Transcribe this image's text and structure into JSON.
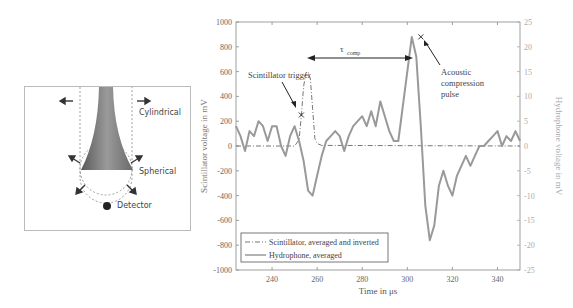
{
  "diagram": {
    "labels": {
      "cylindrical": "Cylindrical",
      "spherical": "Spherical",
      "detector": "Detector"
    }
  },
  "chart_data": {
    "type": "line",
    "xlabel": "Time in μs",
    "ylabel_left": "Scintillator voltage in mV",
    "ylabel_right": "Hydrophone voltage in mV",
    "xlim": [
      224,
      350
    ],
    "ylim_left": [
      -1000,
      1000
    ],
    "ylim_right": [
      -25,
      25
    ],
    "x_ticks": [
      "240",
      "260",
      "280",
      "300",
      "320",
      "340"
    ],
    "y_ticks_left": [
      "1000",
      "800",
      "600",
      "400",
      "200",
      "0",
      "-200",
      "-400",
      "-600",
      "-800",
      "-1000"
    ],
    "y_ticks_right": [
      "25",
      "20",
      "15",
      "10",
      "5",
      "0",
      "-5",
      "-10",
      "-15",
      "-20",
      "-25"
    ],
    "annotations": {
      "tau": "τ",
      "tau_sub": "comp",
      "trigger": "Scintillator trigger",
      "pulse_line1": "Acoustic",
      "pulse_line2": "compression",
      "pulse_line3": "pulse"
    },
    "legend": [
      {
        "name": "Scintillator, averaged and inverted",
        "style": "dash-dot"
      },
      {
        "name": "Hydrophone, averaged",
        "style": "solid"
      }
    ],
    "series": [
      {
        "name": "Scintillator, averaged and inverted",
        "axis": "left",
        "x": [
          224,
          250,
          252,
          253,
          254,
          255,
          256,
          257,
          258,
          259,
          260,
          262,
          350
        ],
        "values": [
          0,
          0,
          50,
          250,
          480,
          590,
          600,
          540,
          300,
          60,
          20,
          5,
          0
        ]
      },
      {
        "name": "Hydrophone, averaged",
        "axis": "right",
        "x": [
          224,
          226,
          228,
          230,
          232,
          234,
          236,
          238,
          240,
          242,
          244,
          246,
          248,
          250,
          252,
          254,
          256,
          258,
          260,
          262,
          264,
          266,
          268,
          270,
          272,
          274,
          276,
          278,
          280,
          282,
          284,
          286,
          288,
          290,
          292,
          294,
          296,
          298,
          300,
          302,
          304,
          306,
          308,
          310,
          312,
          314,
          316,
          318,
          320,
          322,
          324,
          326,
          328,
          330,
          332,
          334,
          336,
          338,
          340,
          342,
          344,
          346,
          348,
          350
        ],
        "values": [
          4,
          2,
          -1,
          3,
          2,
          5,
          4,
          1,
          4,
          4,
          0,
          -2,
          2,
          4,
          1,
          -3,
          -9,
          -10,
          -6,
          -2,
          1,
          2,
          3,
          2,
          -1,
          2,
          4,
          5,
          6,
          4,
          7,
          4,
          9,
          6,
          3,
          1,
          1,
          8,
          15,
          22,
          18,
          4,
          -12,
          -19,
          -16,
          -8,
          -5,
          -8,
          -10,
          -6,
          -4,
          -2,
          -4,
          -2,
          0,
          0,
          1,
          2,
          3,
          0,
          2,
          1,
          3,
          1
        ]
      }
    ],
    "markers": [
      {
        "series": "Scintillator, averaged and inverted",
        "x": 253,
        "y": 250,
        "symbol": "x"
      },
      {
        "series": "Hydrophone, averaged",
        "x": 306,
        "y": 22,
        "symbol": "x"
      }
    ]
  }
}
